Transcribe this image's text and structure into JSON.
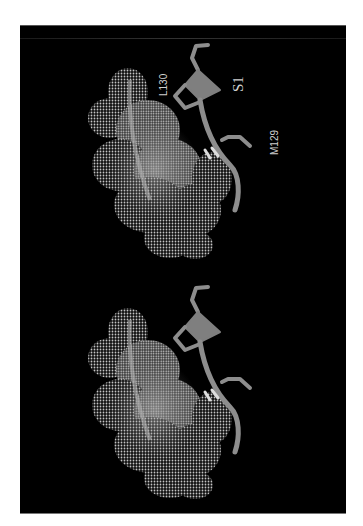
{
  "figure": {
    "background_color": "#000000",
    "page_color": "#ffffff",
    "surface_color": "#d8d8d8",
    "ligand_color": "#8a8a8a"
  },
  "labels": {
    "residue_left": "L130",
    "site": "S1",
    "residue_right": "M129"
  },
  "views": [
    {
      "name": "upper-stereo-view",
      "labeled": true
    },
    {
      "name": "lower-stereo-view",
      "labeled": false
    }
  ]
}
